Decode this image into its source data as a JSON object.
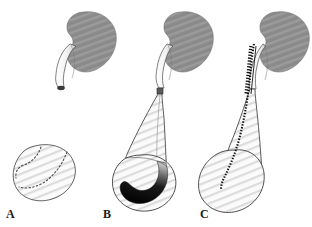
{
  "figure": {
    "panels": [
      {
        "id": "A",
        "label": "A",
        "caption": "Normal kidney with tapered distal ureter and normal bladder",
        "label_x": 6,
        "label_y": 218,
        "kidney": {
          "present": true,
          "center_x": 84,
          "center_y": 43
        },
        "ureter": {
          "state": "normal-tapered",
          "dilated": false,
          "stent": false
        },
        "bladder": {
          "state": "normal",
          "fill": "hatched-light",
          "dark_crescent": false,
          "dotted_trigone": true
        }
      },
      {
        "id": "B",
        "label": "B",
        "caption": "Obstructed megaureter with massively dilated distal ureter and refluxing bladder",
        "label_x": 103,
        "label_y": 218,
        "kidney": {
          "present": true,
          "center_x": 181,
          "center_y": 43
        },
        "ureter": {
          "state": "megaureter-funnel",
          "dilated": true,
          "stent": false
        },
        "bladder": {
          "state": "distended",
          "fill": "hatched-light",
          "dark_crescent": true,
          "dotted_trigone": false
        }
      },
      {
        "id": "C",
        "label": "C",
        "caption": "Dilated ureter after placement of indwelling double-J ureteral stent",
        "label_x": 200,
        "label_y": 218,
        "kidney": {
          "present": true,
          "center_x": 277,
          "center_y": 43
        },
        "ureter": {
          "state": "dilated-stented",
          "dilated": true,
          "stent": true
        },
        "bladder": {
          "state": "dilated",
          "fill": "hatched-light",
          "dark_crescent": false,
          "dotted_trigone": false
        }
      }
    ],
    "colors": {
      "kidney_gray": "#8a8a8a",
      "kidney_stripe": "#9a9a9a",
      "outline": "#333333",
      "hatch_light": "#d8d8d8",
      "tissue_fill": "#fbfbfb",
      "dark_crescent": "#000000",
      "stent_marks": "#111111",
      "background": "#ffffff",
      "label_color": "#1a1a1a"
    }
  }
}
